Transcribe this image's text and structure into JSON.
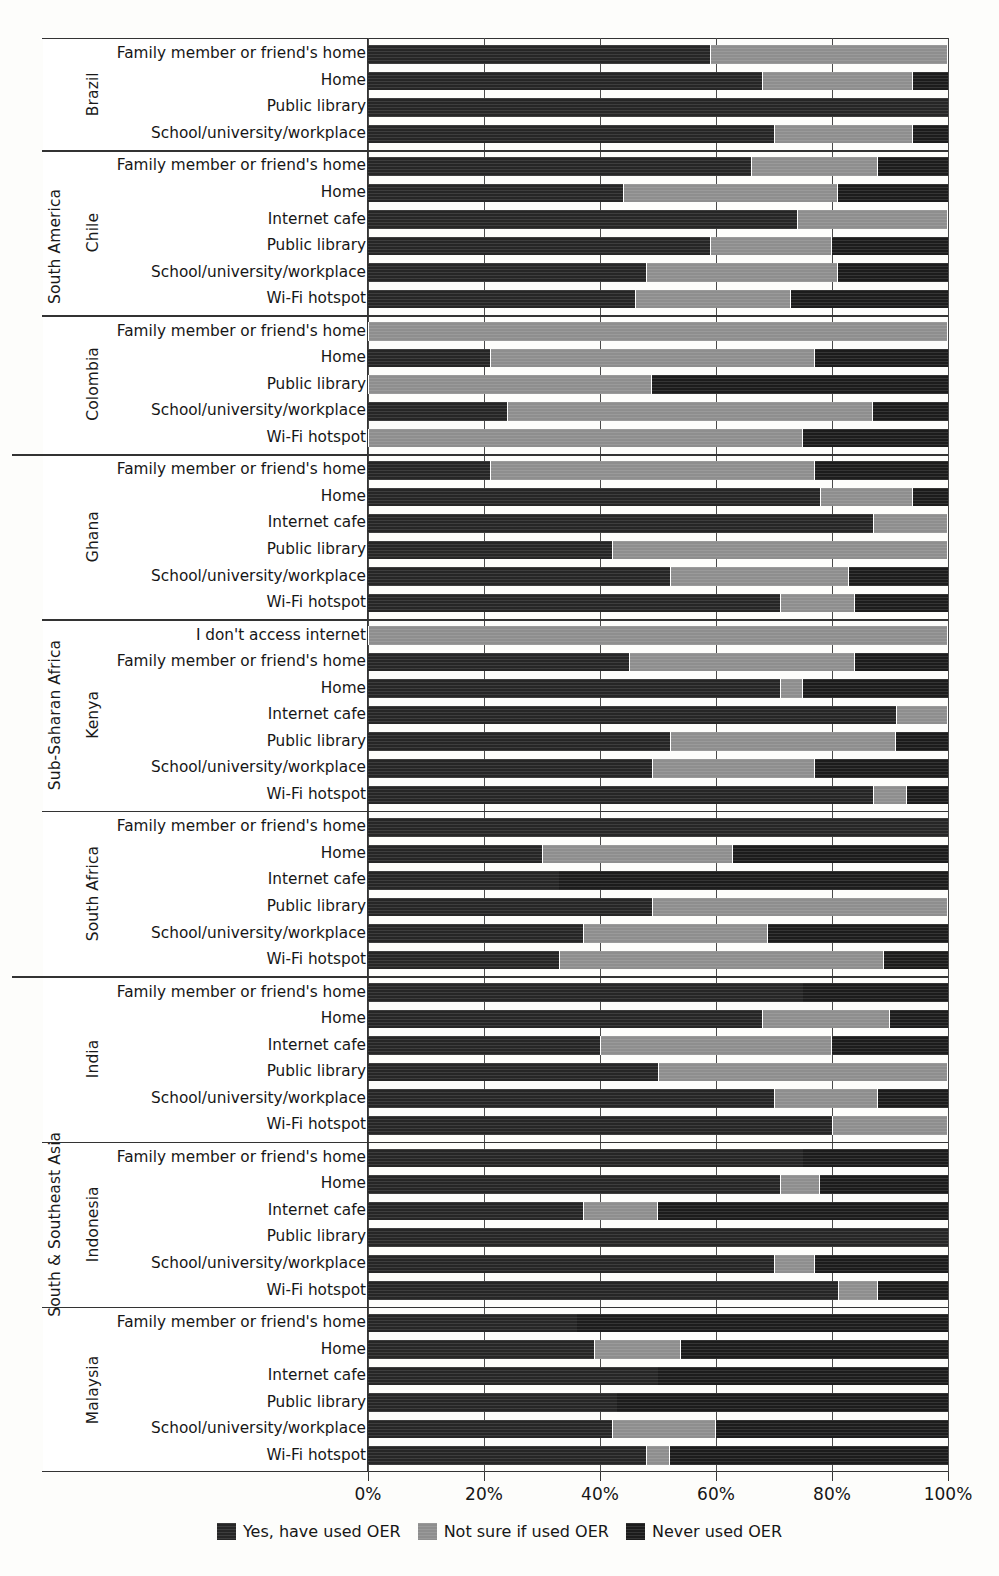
{
  "legend": {
    "items": [
      {
        "label": "Yes, have used OER",
        "key": "yes",
        "color": "#262626"
      },
      {
        "label": "Not sure if used OER",
        "key": "notsure",
        "color": "#8e8e8e"
      },
      {
        "label": "Never used OER",
        "key": "never",
        "color": "#1c1c1c"
      }
    ]
  },
  "axis": {
    "ticks": [
      "0%",
      "20%",
      "40%",
      "60%",
      "80%",
      "100%"
    ]
  },
  "regions": [
    {
      "name": "South America"
    },
    {
      "name": "Sub-Saharan Africa"
    },
    {
      "name": "South & Southeast Asia"
    }
  ],
  "countries": [
    "Brazil",
    "Chile",
    "Colombia",
    "Ghana",
    "Kenya",
    "South Africa",
    "India",
    "Indonesia",
    "Malaysia"
  ],
  "categories": [
    "I don't access internet",
    "Family member or friend's home",
    "Home",
    "Internet cafe",
    "Public library",
    "School/university/workplace",
    "Wi-Fi hotspot"
  ],
  "chart_data": {
    "type": "bar",
    "orientation": "horizontal",
    "stacked": true,
    "normalized": true,
    "title": "",
    "xlabel": "",
    "ylabel": "",
    "xlim": [
      0,
      100
    ],
    "xticks": [
      0,
      20,
      40,
      60,
      80,
      100
    ],
    "grid": true,
    "legend_position": "bottom",
    "series": [
      {
        "name": "Yes, have used OER",
        "key": "yes",
        "color": "#262626"
      },
      {
        "name": "Not sure if used OER",
        "key": "notsure",
        "color": "#8e8e8e"
      },
      {
        "name": "Never used OER",
        "key": "never",
        "color": "#1c1c1c"
      }
    ],
    "groups": [
      {
        "region": "South America",
        "country": "Brazil",
        "rows": [
          {
            "category": "Family member or friend's home",
            "yes": 59,
            "notsure": 41,
            "never": 0
          },
          {
            "category": "Home",
            "yes": 68,
            "notsure": 26,
            "never": 6
          },
          {
            "category": "Public library",
            "yes": 100,
            "notsure": 0,
            "never": 0
          },
          {
            "category": "School/university/workplace",
            "yes": 70,
            "notsure": 24,
            "never": 6
          }
        ]
      },
      {
        "region": "South America",
        "country": "Chile",
        "rows": [
          {
            "category": "Family member or friend's home",
            "yes": 66,
            "notsure": 22,
            "never": 12
          },
          {
            "category": "Home",
            "yes": 44,
            "notsure": 37,
            "never": 19
          },
          {
            "category": "Internet cafe",
            "yes": 74,
            "notsure": 26,
            "never": 0
          },
          {
            "category": "Public library",
            "yes": 59,
            "notsure": 21,
            "never": 20
          },
          {
            "category": "School/university/workplace",
            "yes": 48,
            "notsure": 33,
            "never": 19
          },
          {
            "category": "Wi-Fi hotspot",
            "yes": 46,
            "notsure": 27,
            "never": 27
          }
        ]
      },
      {
        "region": "South America",
        "country": "Colombia",
        "rows": [
          {
            "category": "Family member or friend's home",
            "yes": 0,
            "notsure": 100,
            "never": 0
          },
          {
            "category": "Home",
            "yes": 21,
            "notsure": 56,
            "never": 23
          },
          {
            "category": "Public library",
            "yes": 0,
            "notsure": 49,
            "never": 51
          },
          {
            "category": "School/university/workplace",
            "yes": 24,
            "notsure": 63,
            "never": 13
          },
          {
            "category": "Wi-Fi hotspot",
            "yes": 0,
            "notsure": 75,
            "never": 25
          }
        ]
      },
      {
        "region": "Sub-Saharan Africa",
        "country": "Ghana",
        "rows": [
          {
            "category": "Family member or friend's home",
            "yes": 21,
            "notsure": 56,
            "never": 23
          },
          {
            "category": "Home",
            "yes": 78,
            "notsure": 16,
            "never": 6
          },
          {
            "category": "Internet cafe",
            "yes": 87,
            "notsure": 13,
            "never": 0
          },
          {
            "category": "Public library",
            "yes": 42,
            "notsure": 58,
            "never": 0
          },
          {
            "category": "School/university/workplace",
            "yes": 52,
            "notsure": 31,
            "never": 17
          },
          {
            "category": "Wi-Fi hotspot",
            "yes": 71,
            "notsure": 13,
            "never": 16
          }
        ]
      },
      {
        "region": "Sub-Saharan Africa",
        "country": "Kenya",
        "rows": [
          {
            "category": "I don't access internet",
            "yes": 0,
            "notsure": 100,
            "never": 0
          },
          {
            "category": "Family member or friend's home",
            "yes": 45,
            "notsure": 39,
            "never": 16
          },
          {
            "category": "Home",
            "yes": 71,
            "notsure": 4,
            "never": 25
          },
          {
            "category": "Internet cafe",
            "yes": 91,
            "notsure": 9,
            "never": 0
          },
          {
            "category": "Public library",
            "yes": 52,
            "notsure": 39,
            "never": 9
          },
          {
            "category": "School/university/workplace",
            "yes": 49,
            "notsure": 28,
            "never": 23
          },
          {
            "category": "Wi-Fi hotspot",
            "yes": 87,
            "notsure": 6,
            "never": 7
          }
        ]
      },
      {
        "region": "Sub-Saharan Africa",
        "country": "South Africa",
        "rows": [
          {
            "category": "Family member or friend's home",
            "yes": 100,
            "notsure": 0,
            "never": 0
          },
          {
            "category": "Home",
            "yes": 30,
            "notsure": 33,
            "never": 37
          },
          {
            "category": "Internet cafe",
            "yes": 33,
            "notsure": 0,
            "never": 67
          },
          {
            "category": "Public library",
            "yes": 49,
            "notsure": 51,
            "never": 0
          },
          {
            "category": "School/university/workplace",
            "yes": 37,
            "notsure": 32,
            "never": 31
          },
          {
            "category": "Wi-Fi hotspot",
            "yes": 33,
            "notsure": 56,
            "never": 11
          }
        ]
      },
      {
        "region": "South & Southeast Asia",
        "country": "India",
        "rows": [
          {
            "category": "Family member or friend's home",
            "yes": 75,
            "notsure": 0,
            "never": 25
          },
          {
            "category": "Home",
            "yes": 68,
            "notsure": 22,
            "never": 10
          },
          {
            "category": "Internet cafe",
            "yes": 40,
            "notsure": 40,
            "never": 20
          },
          {
            "category": "Public library",
            "yes": 50,
            "notsure": 50,
            "never": 0
          },
          {
            "category": "School/university/workplace",
            "yes": 70,
            "notsure": 18,
            "never": 12
          },
          {
            "category": "Wi-Fi hotspot",
            "yes": 80,
            "notsure": 20,
            "never": 0
          }
        ]
      },
      {
        "region": "South & Southeast Asia",
        "country": "Indonesia",
        "rows": [
          {
            "category": "Family member or friend's home",
            "yes": 75,
            "notsure": 0,
            "never": 25
          },
          {
            "category": "Home",
            "yes": 71,
            "notsure": 7,
            "never": 22
          },
          {
            "category": "Internet cafe",
            "yes": 37,
            "notsure": 13,
            "never": 50
          },
          {
            "category": "Public library",
            "yes": 100,
            "notsure": 0,
            "never": 0
          },
          {
            "category": "School/university/workplace",
            "yes": 70,
            "notsure": 7,
            "never": 23
          },
          {
            "category": "Wi-Fi hotspot",
            "yes": 81,
            "notsure": 7,
            "never": 12
          }
        ]
      },
      {
        "region": "South & Southeast Asia",
        "country": "Malaysia",
        "rows": [
          {
            "category": "Family member or friend's home",
            "yes": 36,
            "notsure": 0,
            "never": 64
          },
          {
            "category": "Home",
            "yes": 39,
            "notsure": 15,
            "never": 46
          },
          {
            "category": "Internet cafe",
            "yes": 50,
            "notsure": 0,
            "never": 50
          },
          {
            "category": "Public library",
            "yes": 43,
            "notsure": 0,
            "never": 57
          },
          {
            "category": "School/university/workplace",
            "yes": 42,
            "notsure": 18,
            "never": 40
          },
          {
            "category": "Wi-Fi hotspot",
            "yes": 48,
            "notsure": 4,
            "never": 48
          }
        ]
      }
    ]
  }
}
